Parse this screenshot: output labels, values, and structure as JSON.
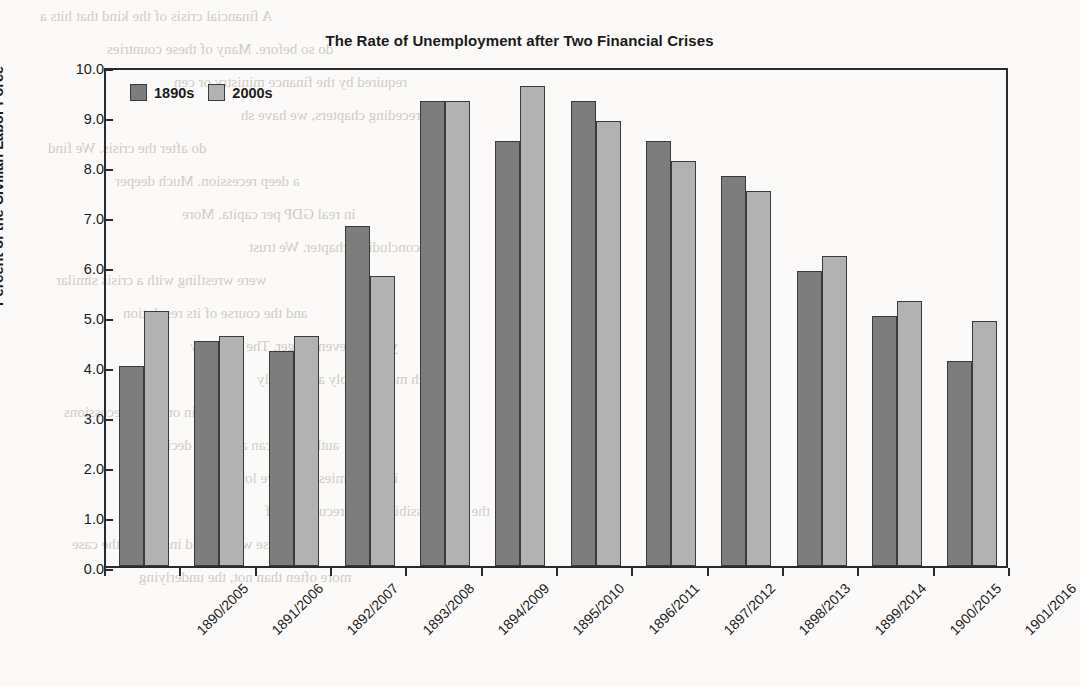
{
  "chart_data": {
    "type": "bar",
    "title": "The Rate of Unemployment after Two Financial Crises",
    "xlabel": "",
    "ylabel": "Percent of the Civilian Labor Force",
    "ylim": [
      0.0,
      10.0
    ],
    "ytick_step": 1.0,
    "ytick_labels": [
      "0.0",
      "1.0",
      "2.0",
      "3.0",
      "4.0",
      "5.0",
      "6.0",
      "7.0",
      "8.0",
      "9.0",
      "10.0"
    ],
    "grid": false,
    "legend_position": "top-left-inside",
    "categories": [
      "1890/2005",
      "1891/2006",
      "1892/2007",
      "1893/2008",
      "1894/2009",
      "1895/2010",
      "1896/2011",
      "1897/2012",
      "1898/2013",
      "1899/2014",
      "1900/2015",
      "1901/2016"
    ],
    "series": [
      {
        "name": "1890s",
        "color": "#7d7d7d",
        "values": [
          4.0,
          4.5,
          4.3,
          6.8,
          9.3,
          8.5,
          9.3,
          8.5,
          7.8,
          5.9,
          5.0,
          4.1
        ]
      },
      {
        "name": "2000s",
        "color": "#b2b2b2",
        "values": [
          5.1,
          4.6,
          4.6,
          5.8,
          9.3,
          9.6,
          8.9,
          8.1,
          7.5,
          6.2,
          5.3,
          4.9
        ]
      }
    ]
  },
  "ghost_text": {
    "lines": [
      "A financial crisis of the kind that hits a",
      "do so before. Many of these countries",
      "required by the finance ministry or cen",
      "in the preceding chapters, we have sh",
      "do after the crisis. We find",
      "a deep recession. Much deeper",
      "in real GDP per capita. More",
      "a concluding chapter. We trust",
      "were wrestling with a crisis similar",
      "and the course of its resolution",
      "years or even longer. The recovery",
      "much more sharply and steeply",
      "than in ordinary recessions",
      "authorities can act more decisively",
      "in economies that have long been",
      "the very possibility of a recurrence of",
      "those who would insist that the case",
      "more often than not, the underlying"
    ]
  }
}
